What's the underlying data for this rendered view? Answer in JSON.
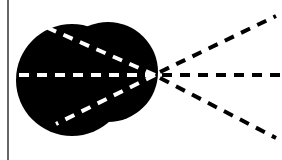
{
  "diagram": {
    "description": "Black blob shape with dashed rays diverging from a focal point",
    "colors": {
      "background": "#ffffff",
      "shape": "#000000",
      "dash_inside": "#ffffff",
      "dash_outside": "#000000",
      "border_line": "#333333"
    },
    "focal_point": {
      "x": 155,
      "y": 75
    },
    "shape": {
      "circles": [
        {
          "cx": 72,
          "cy": 80,
          "r": 56
        },
        {
          "cx": 108,
          "cy": 72,
          "r": 50
        }
      ]
    },
    "inner_rays": [
      {
        "x1": 155,
        "y1": 75,
        "x2": 48,
        "y2": 28
      },
      {
        "x1": 155,
        "y1": 75,
        "x2": 18,
        "y2": 75
      },
      {
        "x1": 155,
        "y1": 75,
        "x2": 56,
        "y2": 124
      }
    ],
    "outer_rays": [
      {
        "x1": 158,
        "y1": 73,
        "x2": 276,
        "y2": 16
      },
      {
        "x1": 160,
        "y1": 75,
        "x2": 282,
        "y2": 75
      },
      {
        "x1": 158,
        "y1": 77,
        "x2": 276,
        "y2": 138
      }
    ],
    "left_border": {
      "x": 8,
      "y1": 0,
      "y2": 160
    }
  }
}
